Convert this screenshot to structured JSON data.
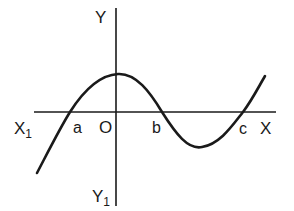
{
  "diagram": {
    "type": "cubic-function-graph",
    "colors": {
      "background": "#ffffff",
      "ink": "#1a1a1a"
    },
    "axes": {
      "x_axis": {
        "positive_label": "X",
        "negative_label": "X",
        "negative_subscript": "1"
      },
      "y_axis": {
        "positive_label": "Y",
        "negative_label": "Y",
        "negative_subscript": "1"
      },
      "origin_label": "O"
    },
    "roots": [
      {
        "label": "a",
        "position": "left of origin"
      },
      {
        "label": "b",
        "position": "right of origin"
      },
      {
        "label": "c",
        "position": "further right"
      }
    ],
    "curve_features": {
      "local_maximum": "just right of the y-axis, above x-axis",
      "local_minimum": "between b and c, below x-axis",
      "left_end": "descends below x-axis to lower left",
      "right_end": "rises above x-axis to upper right"
    }
  }
}
